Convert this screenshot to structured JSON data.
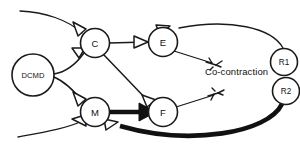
{
  "figure": {
    "type": "neural-circuit-diagram",
    "background_color": "#ffffff",
    "line_color": "#1a1a1a",
    "width": 300,
    "height": 148
  },
  "nodes": [
    {
      "id": "DCMD",
      "label": "DCMD",
      "cx": 33,
      "cy": 75,
      "r": 21,
      "label_size": "micro"
    },
    {
      "id": "C",
      "label": "C",
      "cx": 95,
      "cy": 43,
      "r": 14.5,
      "label_size": "small"
    },
    {
      "id": "E",
      "label": "E",
      "cx": 163,
      "cy": 42,
      "r": 14.5,
      "label_size": "small"
    },
    {
      "id": "M",
      "label": "M",
      "cx": 95,
      "cy": 112,
      "r": 14.5,
      "label_size": "small"
    },
    {
      "id": "F",
      "label": "F",
      "cx": 163,
      "cy": 112,
      "r": 14.5,
      "label_size": "small"
    },
    {
      "id": "R1",
      "label": "R1",
      "cx": 284,
      "cy": 62,
      "r": 13.5,
      "label_size": "tiny"
    },
    {
      "id": "R2",
      "label": "R2",
      "cx": 286,
      "cy": 91,
      "r": 13.5,
      "label_size": "tiny"
    }
  ],
  "annotations": [
    {
      "id": "co-contraction",
      "text": "Co-contraction",
      "x": 205,
      "y": 66
    }
  ],
  "connections": [
    {
      "id": "sensory-top-to-C",
      "from": "sensory-input-top",
      "to": "C",
      "style": "thin",
      "synapse": "open"
    },
    {
      "id": "sensory-bot-to-M",
      "from": "sensory-input-bottom",
      "to": "M",
      "style": "thin",
      "synapse": "open"
    },
    {
      "id": "DCMD-to-C",
      "from": "DCMD",
      "to": "C",
      "style": "thin",
      "synapse": "open"
    },
    {
      "id": "DCMD-to-M",
      "from": "DCMD",
      "to": "M",
      "style": "thin",
      "synapse": "open"
    },
    {
      "id": "C-to-E",
      "from": "C",
      "to": "E",
      "style": "thin",
      "synapse": "open"
    },
    {
      "id": "C-to-F",
      "from": "C",
      "to": "F",
      "style": "thin",
      "synapse": "open"
    },
    {
      "id": "M-to-F",
      "from": "M",
      "to": "F",
      "style": "thick",
      "synapse": "filled"
    },
    {
      "id": "R1-to-E",
      "from": "R1",
      "to": "E",
      "style": "thin",
      "synapse": "open"
    },
    {
      "id": "R2-to-M",
      "from": "R2",
      "to": "M",
      "style": "thick",
      "synapse": "open"
    },
    {
      "id": "E-to-muscle",
      "from": "E",
      "to": "extensor-muscle-terminal",
      "style": "thin",
      "synapse": "terminal"
    },
    {
      "id": "F-to-muscle",
      "from": "F",
      "to": "flexor-muscle-terminal",
      "style": "thin",
      "synapse": "terminal"
    }
  ]
}
